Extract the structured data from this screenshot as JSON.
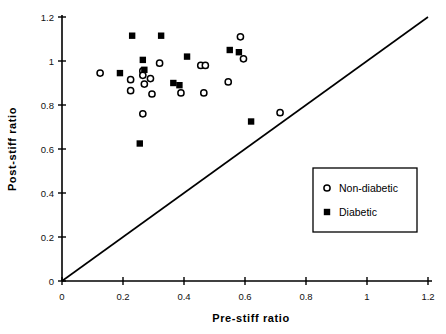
{
  "chart_data": {
    "type": "scatter",
    "title": "",
    "xlabel": "Pre-stiff   ratio",
    "ylabel": "Post-stiff   ratio",
    "xlim": [
      0,
      1.2
    ],
    "ylim": [
      0,
      1.2
    ],
    "xticks": [
      "0",
      "0.2",
      "0.4",
      "0.6",
      "0.8",
      "1",
      "1.2"
    ],
    "yticks": [
      "0",
      "0.2",
      "0.4",
      "0.6",
      "0.8",
      "1",
      "1.2"
    ],
    "xtick_values": [
      0,
      0.2,
      0.4,
      0.6,
      0.8,
      1,
      1.2
    ],
    "ytick_values": [
      0,
      0.2,
      0.4,
      0.6,
      0.8,
      1,
      1.2
    ],
    "grid": false,
    "legend_position": "lower-right",
    "reference_line": {
      "name": "identity-line",
      "from": [
        0,
        0
      ],
      "to": [
        1.2,
        1.2
      ]
    },
    "series": [
      {
        "name": "Non-diabetic",
        "marker": "open-circle",
        "color": "#000000",
        "points": [
          [
            0.125,
            0.945
          ],
          [
            0.225,
            0.915
          ],
          [
            0.225,
            0.865
          ],
          [
            0.265,
            0.955
          ],
          [
            0.265,
            0.935
          ],
          [
            0.27,
            0.895
          ],
          [
            0.265,
            0.76
          ],
          [
            0.29,
            0.92
          ],
          [
            0.295,
            0.85
          ],
          [
            0.32,
            0.99
          ],
          [
            0.39,
            0.855
          ],
          [
            0.455,
            0.98
          ],
          [
            0.47,
            0.98
          ],
          [
            0.465,
            0.855
          ],
          [
            0.545,
            0.905
          ],
          [
            0.585,
            1.11
          ],
          [
            0.595,
            1.01
          ],
          [
            0.715,
            0.765
          ]
        ]
      },
      {
        "name": "Diabetic",
        "marker": "filled-square",
        "color": "#000000",
        "points": [
          [
            0.19,
            0.945
          ],
          [
            0.23,
            1.115
          ],
          [
            0.265,
            1.005
          ],
          [
            0.27,
            0.96
          ],
          [
            0.325,
            1.115
          ],
          [
            0.365,
            0.9
          ],
          [
            0.385,
            0.89
          ],
          [
            0.41,
            1.02
          ],
          [
            0.55,
            1.05
          ],
          [
            0.58,
            1.04
          ],
          [
            0.62,
            0.725
          ],
          [
            0.255,
            0.625
          ]
        ]
      }
    ],
    "legend": [
      {
        "label": "Non-diabetic",
        "marker": "open-circle"
      },
      {
        "label": "Diabetic",
        "marker": "filled-square"
      }
    ]
  }
}
